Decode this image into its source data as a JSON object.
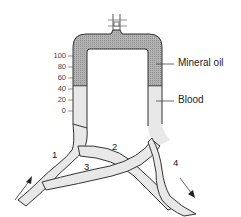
{
  "diagram": {
    "type": "manometer-vessel-shunt",
    "labels": {
      "mineral_oil": "Mineral oil",
      "blood": "Blood"
    },
    "scale": {
      "ticks": [
        "100",
        "80",
        "60",
        "40",
        "20",
        "0"
      ]
    },
    "vessel_numbers": [
      "1",
      "2",
      "3",
      "4"
    ],
    "colors": {
      "oil_fill": "#a8a8a8",
      "blood_fill": "#e6e6e6",
      "outline": "#333333"
    }
  }
}
